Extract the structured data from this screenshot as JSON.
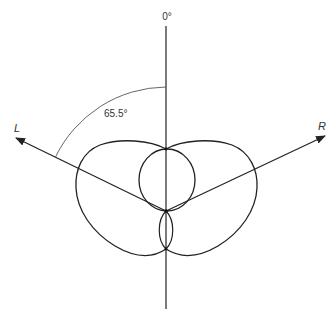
{
  "diagram": {
    "type": "polar-pattern",
    "labels": {
      "axis_top": "0°",
      "angle": "65.5°",
      "left_axis": "L",
      "right_axis": "R"
    },
    "colors": {
      "stroke": "#222222",
      "background": "#ffffff"
    },
    "geometry": {
      "origin": [
        166,
        211
      ],
      "vertical_axis": {
        "top": [
          166,
          26
        ],
        "bottom": [
          166,
          309
        ]
      },
      "left_axis_tip": [
        15,
        138
      ],
      "right_axis_tip": [
        326,
        136
      ],
      "angle_arc_radius": 124,
      "angle_degrees": 65.5
    }
  }
}
